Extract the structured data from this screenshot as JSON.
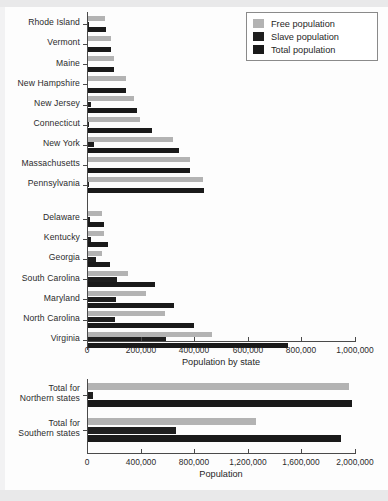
{
  "colors": {
    "free": "#b3b3b3",
    "slave": "#1f1f1f",
    "total": "#1a1a1a",
    "axis": "#4a4a4a",
    "text": "#1f1f1f",
    "background": "#fdfdfd"
  },
  "legend": {
    "items": [
      {
        "label": "Free population",
        "key": "free",
        "color": "#b3b3b3"
      },
      {
        "label": "Slave population",
        "key": "slave",
        "color": "#1f1f1f"
      },
      {
        "label": "Total population",
        "key": "total",
        "color": "#1a1a1a"
      }
    ]
  },
  "chart_data": [
    {
      "id": "by-state",
      "type": "bar",
      "orientation": "horizontal",
      "title": "",
      "xlabel": "Population by state",
      "ylabel": "",
      "xlim": [
        0,
        1000000
      ],
      "xticks": [
        0,
        200000,
        400000,
        600000,
        800000,
        1000000
      ],
      "xticklabels": [
        "0",
        "200,000",
        "400,000",
        "600,000",
        "800,000",
        "1,000,000"
      ],
      "grid": false,
      "legend_position": "top-right",
      "group_gap_after": "Pennsylvania",
      "categories": [
        "Rhode Island",
        "Vermont",
        "Maine",
        "New Hampshire",
        "New Jersey",
        "Connecticut",
        "New York",
        "Massachusetts",
        "Pennsylvania",
        "Delaware",
        "Kentucky",
        "Georgia",
        "South Carolina",
        "Maryland",
        "North Carolina",
        "Virginia"
      ],
      "series": [
        {
          "name": "Free population",
          "values": [
            64470,
            85268,
            96107,
            141727,
            172716,
            194467,
            318796,
            378787,
            430636,
            50207,
            61133,
            53284,
            148073,
            216692,
            288204,
            462582
          ]
        },
        {
          "name": "Slave population",
          "values": [
            958,
            16,
            0,
            158,
            11423,
            2764,
            21324,
            0,
            3737,
            8887,
            12430,
            29264,
            107094,
            103036,
            100572,
            292627
          ]
        },
        {
          "name": "Total population",
          "values": [
            68825,
            85425,
            96540,
            141885,
            184139,
            237946,
            340120,
            378787,
            434373,
            59096,
            73677,
            82548,
            249073,
            319728,
            393751,
            747610
          ]
        }
      ]
    },
    {
      "id": "regional-totals",
      "type": "bar",
      "orientation": "horizontal",
      "title": "",
      "xlabel": "Population",
      "ylabel": "",
      "xlim": [
        0,
        2000000
      ],
      "xticks": [
        0,
        400000,
        800000,
        1200000,
        1600000,
        2000000
      ],
      "xticklabels": [
        "0",
        "400,000",
        "800,000",
        "1,200,000",
        "1,600,000",
        "2,000,000"
      ],
      "grid": false,
      "categories": [
        "Total for\nNorthern states",
        "Total for\nSouthern states"
      ],
      "categories_lines": [
        [
          "Total for",
          "Northern states"
        ],
        [
          "Total for",
          "Southern states"
        ]
      ],
      "series": [
        {
          "name": "Free population",
          "values": [
            1947000,
            1254000
          ]
        },
        {
          "name": "Slave population",
          "values": [
            40340,
            654121
          ]
        },
        {
          "name": "Total population",
          "values": [
            1968000,
            1887000
          ]
        }
      ]
    }
  ]
}
